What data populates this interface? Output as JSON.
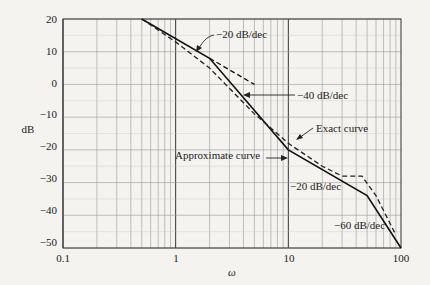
{
  "chart_data": {
    "type": "line",
    "title": "",
    "xlabel": "ω",
    "ylabel": "dB",
    "xscale": "log",
    "xlim": [
      0.1,
      100
    ],
    "ylim": [
      -50,
      20
    ],
    "grid": true,
    "x_ticks": [
      "0.1",
      "1",
      "10",
      "100"
    ],
    "y_ticks": [
      "20",
      "10",
      "0",
      "−10",
      "−20",
      "−30",
      "−40",
      "−50"
    ],
    "series": [
      {
        "name": "Approximate curve",
        "style": "solid",
        "x": [
          0.5,
          2,
          10,
          50,
          100
        ],
        "y": [
          20,
          8,
          -20,
          -34,
          -50
        ]
      },
      {
        "name": "Exact curve",
        "style": "dashed",
        "x": [
          0.5,
          1,
          2,
          5,
          10,
          20,
          30,
          45,
          60,
          90
        ],
        "y": [
          20,
          13,
          5,
          -9,
          -18,
          -25,
          -28,
          -28,
          -34,
          -46
        ]
      },
      {
        "name": "-20 dB/dec extension",
        "style": "dashed",
        "x": [
          2,
          5
        ],
        "y": [
          8,
          0
        ]
      }
    ],
    "annotations": [
      {
        "text": "−20 dB/dec",
        "target_x": 2,
        "target_y": 8
      },
      {
        "text": "−40 dB/dec",
        "target_x": 4.5,
        "target_y": -4
      },
      {
        "text": "Exact curve",
        "target_x": 10,
        "target_y": -16
      },
      {
        "text": "Approximate curve",
        "target_x": 10,
        "target_y": -21
      },
      {
        "text": "−20 dB/dec",
        "target_x": 20,
        "target_y": -26
      },
      {
        "text": "−60 dB/dec",
        "target_x": 70,
        "target_y": -44
      }
    ]
  },
  "labels": {
    "ylabel": "dB",
    "xlabel": "ω",
    "x0": "0.1",
    "x1": "1",
    "x2": "10",
    "x3": "100",
    "y20": "20",
    "y10": "10",
    "y0": "0",
    "ym10": "−10",
    "ym20": "−20",
    "ym30": "−30",
    "ym40": "−40",
    "ym50": "−50",
    "a1": "−20 dB/dec",
    "a2": "−40 dB/dec",
    "a3": "Exact curve",
    "a4": "Approximate curve",
    "a5": "−20 dB/dec",
    "a6": "−60 dB/dec"
  }
}
